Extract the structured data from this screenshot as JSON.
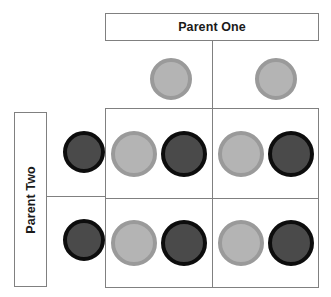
{
  "diagram": {
    "title_parent_one": "Parent One",
    "title_parent_two": "Parent Two"
  },
  "chart_data": {
    "type": "table",
    "xlabel": "Parent One",
    "ylabel": "Parent Two",
    "legend": [
      {
        "name": "light-allele",
        "color": "#b4b4b4",
        "ring": "#9a9a9a"
      },
      {
        "name": "dark-allele",
        "color": "#4a4a4a",
        "ring": "#0d0d0d"
      }
    ],
    "parent_one_gametes": [
      "light",
      "light"
    ],
    "parent_two_gametes": [
      "dark",
      "dark"
    ],
    "categories": [
      "Parent One gamete 1",
      "Parent One gamete 2"
    ],
    "rows": [
      "Parent Two gamete 1",
      "Parent Two gamete 2"
    ],
    "offspring": [
      [
        [
          "light",
          "dark"
        ],
        [
          "light",
          "dark"
        ]
      ],
      [
        [
          "light",
          "dark"
        ],
        [
          "light",
          "dark"
        ]
      ]
    ]
  }
}
